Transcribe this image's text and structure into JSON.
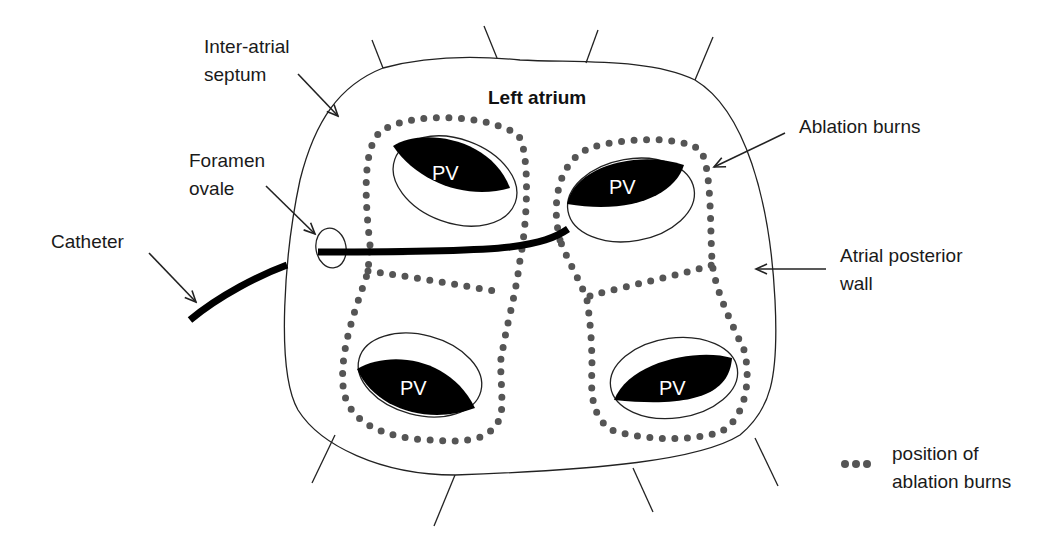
{
  "diagram": {
    "title": "Left atrium",
    "labels": {
      "septum_line1": "Inter-atrial",
      "septum_line2": "septum",
      "foramen_line1": "Foramen",
      "foramen_line2": "ovale",
      "catheter": "Catheter",
      "ablation": "Ablation burns",
      "posterior_line1": "Atrial posterior",
      "posterior_line2": "wall"
    },
    "pulmonary_veins": [
      {
        "id": "upper-left",
        "label": "PV"
      },
      {
        "id": "upper-right",
        "label": "PV"
      },
      {
        "id": "lower-left",
        "label": "PV"
      },
      {
        "id": "lower-right",
        "label": "PV"
      }
    ],
    "legend": {
      "line1": "position of",
      "line2": "ablation burns"
    },
    "colors": {
      "burn_dots": "#555555",
      "vein_fill": "#000000",
      "outline": "#222222"
    }
  }
}
